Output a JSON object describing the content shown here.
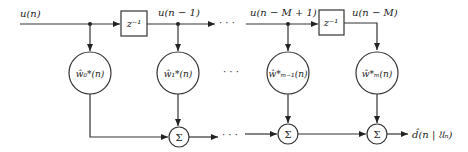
{
  "diagram": {
    "signals": {
      "input": "u(n)",
      "tap1": "u(n − 1)",
      "tapM1": "u(n − M + 1)",
      "tapM": "u(n − M)",
      "output": "d̂(n | 𝔘ₙ)"
    },
    "delays": [
      {
        "label": "z⁻¹"
      },
      {
        "label": "z⁻¹"
      }
    ],
    "weights": [
      {
        "label": "ŵ₀*(n)"
      },
      {
        "label": "ŵ₁*(n)"
      },
      {
        "label": "ŵ*ₘ₋₁(n)"
      },
      {
        "label": "ŵ*ₘ(n)"
      }
    ],
    "summers": [
      {
        "label": "Σ"
      },
      {
        "label": "Σ"
      },
      {
        "label": "Σ"
      }
    ],
    "ellipsis": "· · ·"
  },
  "colors": {
    "stroke": "#333333",
    "text": "#222222",
    "background": "#ffffff"
  }
}
